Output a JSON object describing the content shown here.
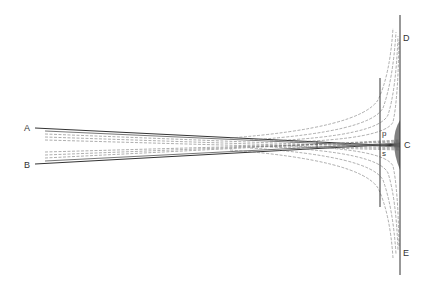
{
  "diagram": {
    "type": "ray-diagram",
    "labels": {
      "A": "A",
      "B": "B",
      "C": "C",
      "D": "D",
      "E": "E",
      "p": "p",
      "s": "s"
    },
    "colors": {
      "line": "#333333",
      "dashed": "#666666",
      "caustic": "#444444",
      "background": "#ffffff"
    }
  }
}
